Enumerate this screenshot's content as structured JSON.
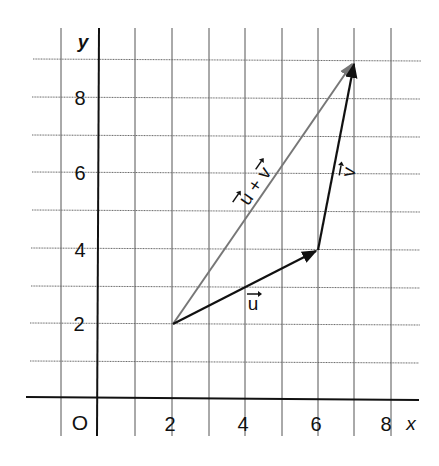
{
  "figure": {
    "axes": {
      "x_label": "x",
      "y_label": "y",
      "origin_label": "O",
      "x_ticks": [
        "2",
        "4",
        "6",
        "8"
      ],
      "y_ticks": [
        "2",
        "4",
        "6",
        "8"
      ]
    },
    "vectors": [
      {
        "id": "u",
        "label": "u",
        "from": [
          2,
          2
        ],
        "to": [
          6,
          4
        ],
        "color": "#111111"
      },
      {
        "id": "v",
        "label": "v",
        "from": [
          6,
          4
        ],
        "to": [
          7,
          9
        ],
        "color": "#111111"
      },
      {
        "id": "u_plus_v",
        "label": "u + v",
        "from": [
          2,
          2
        ],
        "to": [
          7,
          9
        ],
        "color": "#777777"
      }
    ],
    "grid": {
      "x_range": [
        -1,
        8
      ],
      "y_range": [
        0,
        9
      ],
      "step": 1,
      "color": "#444444"
    }
  }
}
